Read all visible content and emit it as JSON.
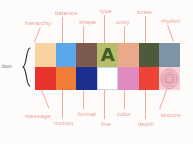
{
  "diagram": {
    "title_label_left": "...tion",
    "background_color": "#fdfcfb",
    "label_color": "#ef9b92",
    "leader_color": "#f2a9a0"
  },
  "top_labels": [
    {
      "text": "hierarchy",
      "x": 25,
      "y": 20
    },
    {
      "text": "balance",
      "x": 55,
      "y": 10
    },
    {
      "text": "shape",
      "x": 79,
      "y": 19
    },
    {
      "text": "type",
      "x": 100,
      "y": 8
    },
    {
      "text": "unity",
      "x": 116,
      "y": 19
    },
    {
      "text": "scale",
      "x": 137,
      "y": 9
    },
    {
      "text": "rhythm",
      "x": 161,
      "y": 18
    }
  ],
  "bottom_labels": [
    {
      "text": "message",
      "x": 25,
      "y": 113
    },
    {
      "text": "motion",
      "x": 54,
      "y": 120
    },
    {
      "text": "format",
      "x": 78,
      "y": 111
    },
    {
      "text": "line",
      "x": 101,
      "y": 121
    },
    {
      "text": "color",
      "x": 117,
      "y": 111
    },
    {
      "text": "depth",
      "x": 138,
      "y": 121
    },
    {
      "text": "texture",
      "x": 161,
      "y": 112
    }
  ],
  "swatches_top": [
    {
      "name": "hierarchy",
      "color": "#f8d3a0",
      "kind": "solid"
    },
    {
      "name": "balance",
      "color": "#5ba8e8",
      "kind": "solid"
    },
    {
      "name": "shape",
      "color": "#7d5a4f",
      "kind": "solid"
    },
    {
      "name": "type",
      "color": "#b9bc6b",
      "kind": "glyph",
      "glyph": "A",
      "glyph_color": "#3f5d21"
    },
    {
      "name": "unity",
      "color": "#eba98b",
      "kind": "solid"
    },
    {
      "name": "scale",
      "color": "#4d5a3c",
      "kind": "solid"
    },
    {
      "name": "rhythm",
      "color": "#7e93a4",
      "kind": "solid"
    }
  ],
  "swatches_bottom": [
    {
      "name": "message",
      "color": "#e8332a",
      "kind": "solid"
    },
    {
      "name": "motion",
      "color": "#f07c35",
      "kind": "solid"
    },
    {
      "name": "format",
      "color": "#1a2f8f",
      "kind": "solid"
    },
    {
      "name": "line",
      "color": "#ffffff",
      "kind": "hairline"
    },
    {
      "name": "color",
      "color": "#e08bc0",
      "kind": "solid"
    },
    {
      "name": "depth",
      "color": "#f04338",
      "kind": "solid"
    },
    {
      "name": "texture",
      "color": "#f6ced6",
      "kind": "texture",
      "pattern_color": "#d98a98"
    }
  ],
  "top_leaders": [
    {
      "x": 40,
      "y": 27,
      "h": 16,
      "kind": "diag",
      "angle": 22
    },
    {
      "x": 62,
      "y": 17,
      "h": 26,
      "kind": "v"
    },
    {
      "x": 83,
      "y": 26,
      "h": 17,
      "kind": "v"
    },
    {
      "x": 104,
      "y": 15,
      "h": 28,
      "kind": "v"
    },
    {
      "x": 124,
      "y": 26,
      "h": 17,
      "kind": "v"
    },
    {
      "x": 145,
      "y": 16,
      "h": 27,
      "kind": "v"
    },
    {
      "x": 167,
      "y": 25,
      "h": 18,
      "kind": "diag",
      "angle": -20
    }
  ],
  "bottom_leaders": [
    {
      "x": 41,
      "y": 90,
      "h": 20,
      "kind": "diag",
      "angle": -22
    },
    {
      "x": 62,
      "y": 90,
      "h": 28,
      "kind": "v"
    },
    {
      "x": 83,
      "y": 90,
      "h": 19,
      "kind": "v"
    },
    {
      "x": 104,
      "y": 90,
      "h": 29,
      "kind": "v"
    },
    {
      "x": 124,
      "y": 90,
      "h": 19,
      "kind": "v"
    },
    {
      "x": 145,
      "y": 90,
      "h": 29,
      "kind": "v"
    },
    {
      "x": 166,
      "y": 90,
      "h": 20,
      "kind": "diag",
      "angle": 20
    }
  ]
}
